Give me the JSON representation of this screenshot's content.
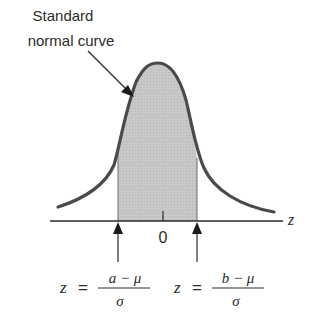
{
  "title_label": {
    "line1": "Standard",
    "line2": "normal curve"
  },
  "axis": {
    "variable": "z",
    "zero_tick": "0"
  },
  "left_bound": {
    "lhs": "z",
    "equals": "=",
    "numerator": "a − μ",
    "denominator": "σ"
  },
  "right_bound": {
    "lhs": "z",
    "equals": "=",
    "numerator": "b − μ",
    "denominator": "σ"
  },
  "colors": {
    "curve": "#4a4a4a",
    "shade": "#c4c4c4",
    "axis": "#2b2b2b",
    "text": "#2b2b2b"
  }
}
